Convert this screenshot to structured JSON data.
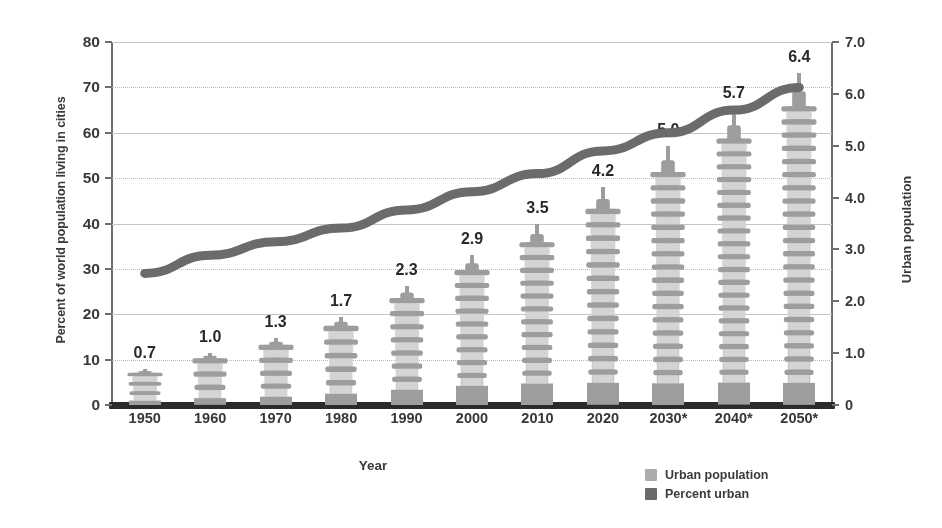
{
  "chart_data": {
    "type": "bar",
    "title": "",
    "subtitle": "",
    "xlabel": "Year",
    "ylabel": "Percent of world population living in cities",
    "y2label": "Urban population",
    "categories": [
      "1950",
      "1960",
      "1970",
      "1980",
      "1990",
      "2000",
      "2010",
      "2020",
      "2030*",
      "2040*",
      "2050*"
    ],
    "ylim": [
      0,
      80
    ],
    "y2lim": [
      0,
      7.0
    ],
    "yticks": [
      "0",
      "10",
      "20",
      "30",
      "40",
      "50",
      "60",
      "70",
      "80"
    ],
    "y2ticks": [
      "0",
      "1.0",
      "2.0",
      "3.0",
      "4.0",
      "5.0",
      "6.0",
      "7.0"
    ],
    "grid": true,
    "legend_position": "bottom-right",
    "series": [
      {
        "name": "Urban population",
        "type": "bar",
        "axis": "right",
        "color": "#a8a8a8",
        "values": [
          0.7,
          1.0,
          1.3,
          1.7,
          2.3,
          2.9,
          3.5,
          4.2,
          5.0,
          5.7,
          6.4
        ],
        "labels": [
          "0.7",
          "1.0",
          "1.3",
          "1.7",
          "2.3",
          "2.9",
          "3.5",
          "4.2",
          "5.0",
          "5.7",
          "6.4"
        ]
      },
      {
        "name": "Percent urban",
        "type": "line",
        "axis": "left",
        "color": "#6b6b6b",
        "values": [
          29,
          33,
          36,
          39,
          43,
          47,
          51,
          56,
          60,
          65,
          70
        ]
      }
    ]
  },
  "axes": {
    "left_title": "Percent of world population living in cities",
    "right_title": "Urban population",
    "x_title": "Year",
    "left_ticks": [
      "80",
      "70",
      "60",
      "50",
      "40",
      "30",
      "20",
      "10",
      "0"
    ],
    "right_ticks": [
      "7.0",
      "6.0",
      "5.0",
      "4.0",
      "3.0",
      "2.0",
      "1.0",
      "0"
    ],
    "x_ticks": [
      "1950",
      "1960",
      "1970",
      "1980",
      "1990",
      "2000",
      "2010",
      "2020",
      "2030*",
      "2040*",
      "2050*"
    ]
  },
  "legend": {
    "items": [
      {
        "label": "Urban population",
        "color": "#ababab"
      },
      {
        "label": "Percent urban",
        "color": "#6a6a6a"
      }
    ]
  },
  "colors": {
    "bar_fill": "#a9a9a9",
    "bar_light": "#cfcfcf",
    "line": "#6b6b6b",
    "axis": "#6e6e6e",
    "baseline": "#2d2d2d",
    "grid": "#bdbdbd",
    "text": "#3a3a3a",
    "background": "#ffffff"
  }
}
